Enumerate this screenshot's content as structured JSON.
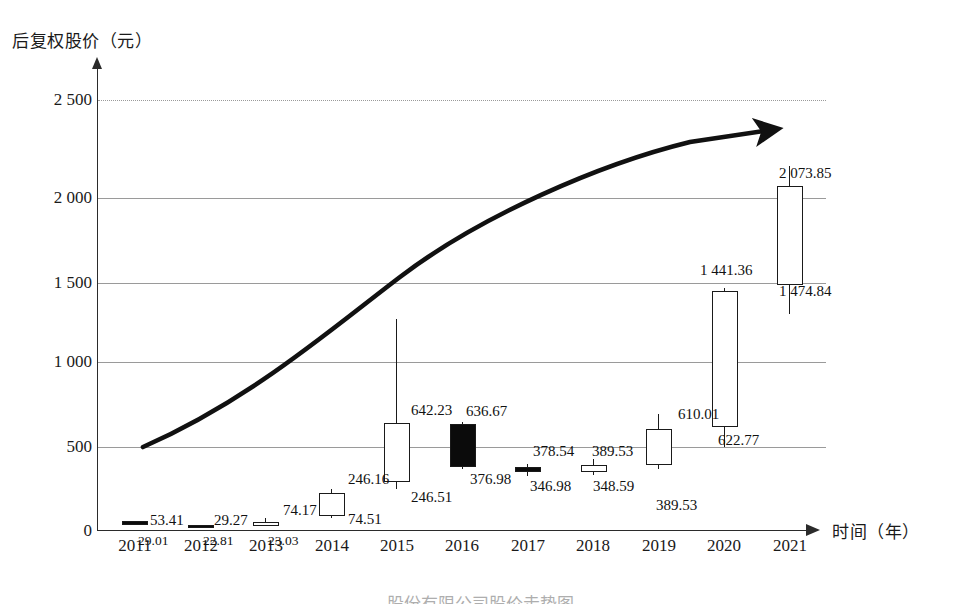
{
  "chart_data": {
    "type": "bar",
    "subtype": "candlestick-ohlc-with-trendline",
    "title": "",
    "xlabel": "时间（年）",
    "ylabel": "后复权股价（元）",
    "ylim": [
      0,
      2600
    ],
    "yticks": [
      0,
      500,
      1000,
      1500,
      2000,
      2500
    ],
    "ytick_labels": [
      "0",
      "500",
      "1 000",
      "1 500",
      "2 000",
      "2 500"
    ],
    "grid": true,
    "legend": "none",
    "categories": [
      "2011",
      "2012",
      "2013",
      "2014",
      "2015",
      "2016",
      "2017",
      "2018",
      "2019",
      "2020",
      "2021"
    ],
    "series": [
      {
        "name": "后复权股价",
        "points": [
          {
            "x": "2011",
            "top_label": "53.41",
            "bottom_label": "29.01",
            "high": 53.41,
            "low": 29.01,
            "body_top": 53.41,
            "body_bottom": 29.01,
            "filled": true,
            "wick_up": 0,
            "wick_down": 0
          },
          {
            "x": "2012",
            "top_label": "29.27",
            "bottom_label": "22.81",
            "high": 29.27,
            "low": 22.81,
            "body_top": 29.27,
            "body_bottom": 22.81,
            "filled": true,
            "wick_up": 0,
            "wick_down": 0
          },
          {
            "x": "2013",
            "top_label": "74.17",
            "bottom_label": "23.03",
            "high": 74.17,
            "low": 23.03,
            "body_top": 48.0,
            "body_bottom": 23.03,
            "filled": false,
            "wick_up": 1,
            "wick_down": 0
          },
          {
            "x": "2014",
            "top_label": "246.16",
            "bottom_label": "74.51",
            "high": 246.16,
            "low": 74.51,
            "body_top": 222.0,
            "body_bottom": 84.0,
            "filled": false,
            "wick_up": 1,
            "wick_down": 1
          },
          {
            "x": "2015",
            "top_label": "642.23",
            "bottom_label": "246.51",
            "high": 1272.0,
            "low": 246.51,
            "body_top": 642.23,
            "body_bottom": 290.0,
            "filled": false,
            "wick_up": 1,
            "wick_down": 1
          },
          {
            "x": "2016",
            "top_label": "636.67",
            "bottom_label": "376.98",
            "high": 648.0,
            "low": 368.0,
            "body_top": 636.67,
            "body_bottom": 376.98,
            "filled": true,
            "wick_up": 1,
            "wick_down": 1
          },
          {
            "x": "2017",
            "top_label": "378.54",
            "bottom_label": "346.98",
            "high": 400.0,
            "low": 327.0,
            "body_top": 378.54,
            "body_bottom": 346.98,
            "filled": true,
            "wick_up": 1,
            "wick_down": 1
          },
          {
            "x": "2018",
            "top_label": "389.53",
            "bottom_label": "348.59",
            "high": 430.0,
            "low": 330.0,
            "body_top": 389.53,
            "body_bottom": 348.59,
            "filled": false,
            "wick_up": 1,
            "wick_down": 1
          },
          {
            "x": "2019",
            "top_label": "610.01",
            "bottom_label": "389.53",
            "high": 700.0,
            "low": 370.0,
            "body_top": 610.01,
            "body_bottom": 389.53,
            "filled": false,
            "wick_up": 1,
            "wick_down": 1
          },
          {
            "x": "2020",
            "top_label": "1 441.36",
            "bottom_label": "622.77",
            "high": 1460.0,
            "low": 500.0,
            "body_top": 1441.36,
            "body_bottom": 622.77,
            "filled": false,
            "wick_up": 1,
            "wick_down": 1
          },
          {
            "x": "2021",
            "top_label": "2 073.85",
            "bottom_label": "1 474.84",
            "high": 2195.0,
            "low": 1300.0,
            "body_top": 2073.85,
            "body_bottom": 1474.84,
            "filled": false,
            "wick_up": 1,
            "wick_down": 1
          }
        ]
      }
    ],
    "annotations": [
      {
        "name": "trend-arrow",
        "description": "上升趋势箭头",
        "from": [
          2011.2,
          500
        ],
        "to": [
          2020.8,
          2360
        ]
      }
    ]
  },
  "axis": {
    "y_title": "后复权股价（元）",
    "x_title": "时间（年）",
    "y_ticks": [
      "2 500",
      "2 000",
      "1 500",
      "1 000",
      "500",
      "0"
    ],
    "x_ticks": [
      "2011",
      "2012",
      "2013",
      "2014",
      "2015",
      "2016",
      "2017",
      "2018",
      "2019",
      "2020",
      "2021"
    ]
  },
  "labels": {
    "y2011_top": "53.41",
    "y2011_bottom": "29.01",
    "y2012_top": "29.27",
    "y2012_bottom": "22.81",
    "y2013_top": "74.17",
    "y2013_bottom": "23.03",
    "y2014_top": "246.16",
    "y2014_bottom": "74.51",
    "y2015_top": "642.23",
    "y2015_bottom": "246.51",
    "y2016_top": "636.67",
    "y2016_bottom": "376.98",
    "y2017_top": "378.54",
    "y2017_bottom": "346.98",
    "y2018_top": "389.53",
    "y2018_bottom": "348.59",
    "y2019_top": "610.01",
    "y2019_bottom": "389.53",
    "y2020_top": "1 441.36",
    "y2020_bottom": "622.77",
    "y2021_top": "2 073.85",
    "y2021_bottom": "1 474.84"
  },
  "colors": {
    "axis": "#2b2b2b",
    "grid": "#9a9a9a",
    "candle_up": "#ffffff",
    "candle_down": "#0b0b0b",
    "outline": "#1a1a1a",
    "trend": "#111111"
  },
  "caption": "股份有限公司股价走势图"
}
